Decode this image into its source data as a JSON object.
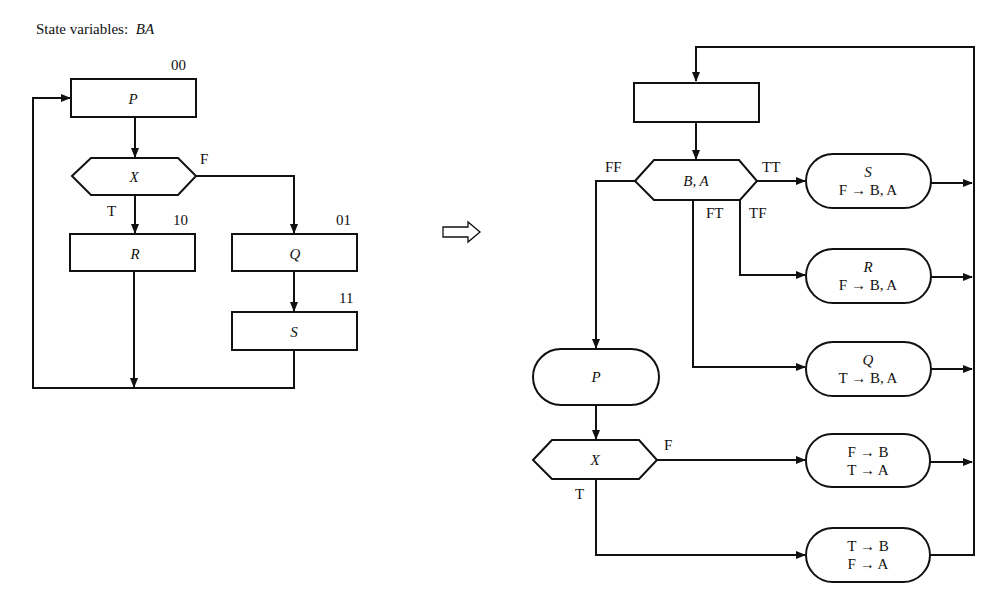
{
  "left_chart": {
    "state_variables_label": "State variables:",
    "state_variables_value": "BA",
    "nodes": {
      "P": {
        "label": "P",
        "code": "00"
      },
      "X": {
        "label": "X",
        "true_label": "T",
        "false_label": "F"
      },
      "R": {
        "label": "R",
        "code": "10"
      },
      "Q": {
        "label": "Q",
        "code": "01"
      },
      "S": {
        "label": "S",
        "code": "11"
      }
    }
  },
  "transform_arrow": "⇨",
  "right_chart": {
    "empty_box": "",
    "decision": {
      "label": "B, A",
      "branches": {
        "ff": "FF",
        "tt": "TT",
        "ft": "FT",
        "tf": "TF"
      }
    },
    "S_box": {
      "title": "S",
      "assign": "F → B, A"
    },
    "R_box": {
      "title": "R",
      "assign": "F → B, A"
    },
    "Q_box": {
      "title": "Q",
      "assign": "T → B, A"
    },
    "P_box": {
      "title": "P"
    },
    "X_decision": {
      "label": "X",
      "false_label": "F",
      "true_label": "T"
    },
    "FT_box": {
      "line1": "F → B",
      "line2": "T → A"
    },
    "TF_box": {
      "line1": "T → B",
      "line2": "F → A"
    }
  },
  "colors": {
    "ink": "#111111",
    "background": "#ffffff"
  }
}
